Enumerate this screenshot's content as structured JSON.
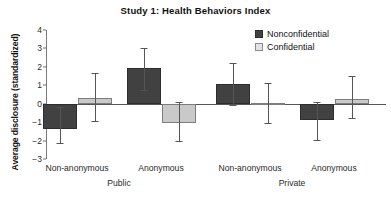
{
  "chart_data": {
    "type": "bar",
    "title": "Study 1: Health Behaviors Index",
    "xlabel": "",
    "ylabel": "Average disclosure (standardized)",
    "ylim": [
      -3,
      4
    ],
    "yticks": [
      4,
      3,
      2,
      1,
      0,
      -1,
      -2,
      -3
    ],
    "ytick_labels": [
      "4",
      "3",
      "2",
      "1",
      "0",
      "−1",
      "−2",
      "−3"
    ],
    "grid": false,
    "legend_position": "top-right",
    "categories": [
      "Non-anonymous",
      "Anonymous",
      "Non-anonymous",
      "Anonymous"
    ],
    "panels": [
      "Public",
      "Private"
    ],
    "panel_labels": [
      {
        "label": "Public",
        "categories": [
          "Non-anonymous",
          "Anonymous"
        ]
      },
      {
        "label": "Private",
        "categories": [
          "Non-anonymous",
          "Anonymous"
        ]
      }
    ],
    "series": [
      {
        "name": "Nonconfidential",
        "color": "#414141",
        "values": [
          -1.35,
          1.92,
          1.05,
          -0.9
        ],
        "error_low": [
          -2.15,
          0.72,
          -0.05,
          -1.98
        ],
        "error_high": [
          -0.2,
          3.05,
          2.2,
          0.1
        ]
      },
      {
        "name": "Confidential",
        "color": "#c9c9c9",
        "values": [
          0.33,
          -1.02,
          0.05,
          0.27
        ],
        "error_low": [
          -0.95,
          -2.05,
          -1.05,
          -0.75
        ],
        "error_high": [
          1.65,
          0.1,
          1.1,
          1.5
        ]
      }
    ],
    "legend": [
      "Nonconfidential",
      "Confidential"
    ]
  }
}
